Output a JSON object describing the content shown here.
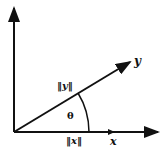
{
  "diagram": {
    "type": "vector-angle",
    "labels": {
      "y_vector": "y",
      "x_vector": "x",
      "y_norm": "‖y‖",
      "x_norm": "‖x‖",
      "angle": "θ"
    },
    "colors": {
      "stroke": "#111111",
      "background": "#ffffff"
    }
  }
}
